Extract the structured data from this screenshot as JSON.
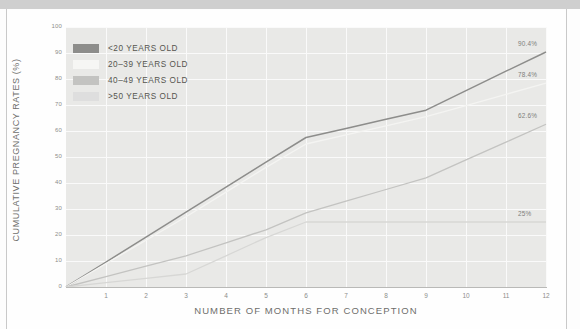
{
  "chart_data": {
    "type": "line",
    "title": "",
    "xlabel": "NUMBER OF MONTHS FOR CONCEPTION",
    "ylabel": "CUMULATIVE PREGNANCY RATES (%)",
    "xlim": [
      0,
      12
    ],
    "ylim": [
      0,
      100
    ],
    "xticks": [
      "1",
      "2",
      "3",
      "4",
      "5",
      "6",
      "7",
      "8",
      "9",
      "10",
      "11",
      "12"
    ],
    "yticks": [
      "0",
      "10",
      "20",
      "30",
      "40",
      "50",
      "60",
      "70",
      "80",
      "90",
      "100"
    ],
    "grid": true,
    "legend_position": "upper-left",
    "x": [
      0,
      1,
      2,
      3,
      4,
      5,
      6,
      7,
      8,
      9,
      10,
      11,
      12
    ],
    "series": [
      {
        "name": "<20 YEARS OLD",
        "color": "#8d8d8b",
        "end_label": "90.4%",
        "values": [
          0,
          9.6,
          19.2,
          28.8,
          38.4,
          48.0,
          57.5,
          61.0,
          64.5,
          68.0,
          75.5,
          83.0,
          90.4
        ]
      },
      {
        "name": "20–39 YEARS OLD",
        "color": "#f4f4f2",
        "end_label": "78.4%",
        "values": [
          0,
          9.0,
          18.0,
          27.0,
          36.5,
          46.0,
          55.0,
          58.5,
          62.0,
          65.5,
          69.8,
          74.1,
          78.4
        ]
      },
      {
        "name": "40–49 YEARS OLD",
        "color": "#c3c3c1",
        "end_label": "62.6%",
        "values": [
          0,
          4.0,
          8.0,
          12.0,
          17.0,
          22.0,
          28.5,
          33.0,
          37.5,
          42.0,
          48.9,
          55.7,
          62.6
        ]
      },
      {
        "name": ">50 YEARS OLD",
        "color": "#d7d7d5",
        "end_label": "25%",
        "values": [
          0,
          1.7,
          3.3,
          5.0,
          12.0,
          19.0,
          25.0,
          25.0,
          25.0,
          25.0,
          25.0,
          25.0,
          25.0
        ]
      }
    ]
  },
  "legend": {
    "items": [
      {
        "label": "<20 YEARS OLD",
        "color": "#8d8d8b"
      },
      {
        "label": "20–39 YEARS OLD",
        "color": "#f6f6f4"
      },
      {
        "label": "40–49 YEARS OLD",
        "color": "#c3c3c1"
      },
      {
        "label": ">50 YEARS OLD",
        "color": "#dedede"
      }
    ]
  }
}
